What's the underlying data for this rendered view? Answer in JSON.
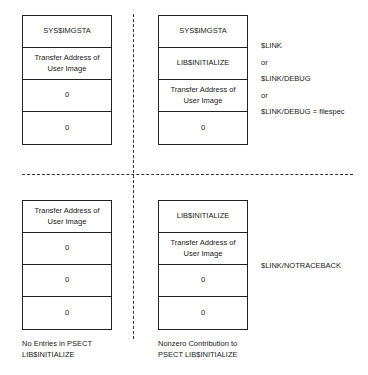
{
  "quadrants": {
    "top_left": {
      "cells": [
        "SYS$IMGSTA",
        "Transfer Address of User Image",
        "0",
        "0"
      ]
    },
    "top_right": {
      "cells": [
        "SYS$IMGSTA",
        "LIB$INITIALIZE",
        "Transfer Address of User Image",
        "0"
      ]
    },
    "bottom_left": {
      "cells": [
        "Transfer Address of User Image",
        "0",
        "0",
        "0"
      ]
    },
    "bottom_right": {
      "cells": [
        "LIB$INITIALIZE",
        "Transfer Address of User Image",
        "0",
        "0"
      ]
    }
  },
  "commands_top": [
    "$LINK",
    "or",
    "$LINK/DEBUG",
    "or",
    "$LINK/DEBUG = filespec"
  ],
  "commands_bottom": [
    "$LINK/NOTRACEBACK"
  ],
  "captions": {
    "left": [
      "No Entries in PSECT",
      "LIB$INITIALIZE"
    ],
    "right": [
      "Nonzero Contribution to",
      "PSECT LIB$INITIALIZE"
    ]
  }
}
